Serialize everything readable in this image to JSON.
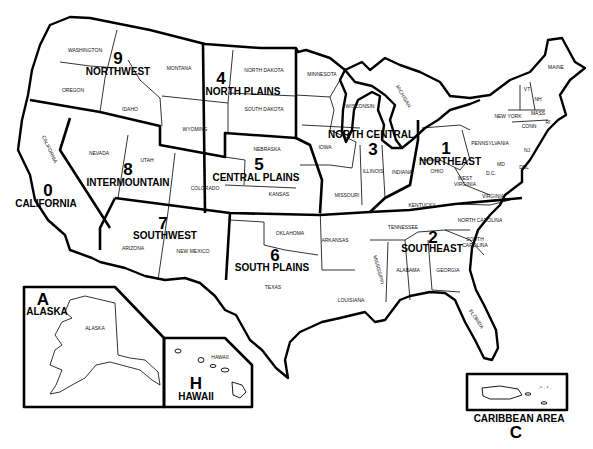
{
  "map": {
    "regions": [
      {
        "code": "9",
        "name": "NORTHWEST"
      },
      {
        "code": "4",
        "name": "NORTH PLAINS"
      },
      {
        "code": "3",
        "name": "NORTH CENTRAL"
      },
      {
        "code": "1",
        "name": "NORTHEAST"
      },
      {
        "code": "5",
        "name": "CENTRAL PLAINS"
      },
      {
        "code": "8",
        "name": "INTERMOUNTAIN"
      },
      {
        "code": "0",
        "name": "CALIFORNIA"
      },
      {
        "code": "7",
        "name": "SOUTHWEST"
      },
      {
        "code": "6",
        "name": "SOUTH PLAINS"
      },
      {
        "code": "2",
        "name": "SOUTHEAST"
      },
      {
        "code": "A",
        "name": "ALASKA"
      },
      {
        "code": "H",
        "name": "HAWAII"
      },
      {
        "code": "C",
        "name": "CARIBBEAN AREA"
      }
    ],
    "states": {
      "washington": "WASHINGTON",
      "oregon": "OREGON",
      "idaho": "IDAHO",
      "montana": "MONTANA",
      "wyoming": "WYOMING",
      "north_dakota": "NORTH DAKOTA",
      "south_dakota": "SOUTH DAKOTA",
      "nebraska": "NEBRASKA",
      "kansas": "KANSAS",
      "minnesota": "MINNESOTA",
      "wisconsin": "WISCONSIN",
      "michigan": "MICHIGAN",
      "iowa": "IOWA",
      "illinois": "ILLINOIS",
      "indiana": "INDIANA",
      "missouri": "MISSOURI",
      "ohio": "OHIO",
      "kentucky": "KENTUCKY",
      "west_virginia_1": "WEST",
      "west_virginia_2": "VIRGINIA",
      "virginia": "VIRGINIA",
      "pennsylvania": "PENNSYLVANIA",
      "new_york": "NEW YORK",
      "maine": "MAINE",
      "vermont": "VT",
      "new_hampshire": "NH",
      "massachusetts": "MASS",
      "connecticut": "CONN",
      "rhode_island": "RI",
      "new_jersey": "NJ",
      "delaware": "DEL",
      "maryland": "MD",
      "dc": "D.C.",
      "nevada": "NEVADA",
      "utah": "UTAH",
      "colorado": "COLORADO",
      "california": "CALIFORNIA",
      "arizona": "ARIZONA",
      "new_mexico": "NEW MEXICO",
      "oklahoma": "OKLAHOMA",
      "texas": "TEXAS",
      "arkansas": "ARKANSAS",
      "louisiana": "LOUISIANA",
      "mississippi": "MISSISSIPPI",
      "alabama": "ALABAMA",
      "tennessee": "TENNESSEE",
      "georgia": "GEORGIA",
      "florida": "FLORIDA",
      "north_carolina": "NORTH CAROLINA",
      "south_carolina_1": "SOUTH",
      "south_carolina_2": "CAROLINA",
      "alaska": "ALASKA",
      "hawaii": "HAWAII"
    }
  }
}
